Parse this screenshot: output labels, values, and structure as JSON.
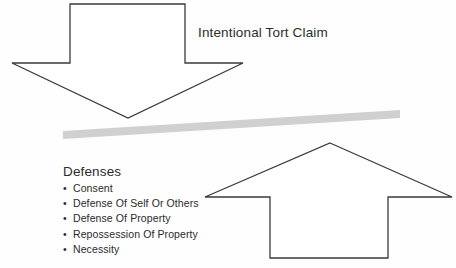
{
  "diagram": {
    "title_label": "Intentional Tort Claim",
    "defenses_heading": "Defenses",
    "bullet_glyph": "•",
    "defenses": [
      {
        "label": "Consent"
      },
      {
        "label": "Defense Of Self Or Others"
      },
      {
        "label": "Defense Of Property"
      },
      {
        "label": "Repossession Of Property"
      },
      {
        "label": "Necessity"
      }
    ],
    "colors": {
      "background": "#fefefe",
      "outline": "#3a3a3a",
      "shape_fill": "#ffffff",
      "beam_fill": "#d0d0d0",
      "text": "#2b2b2b"
    }
  }
}
